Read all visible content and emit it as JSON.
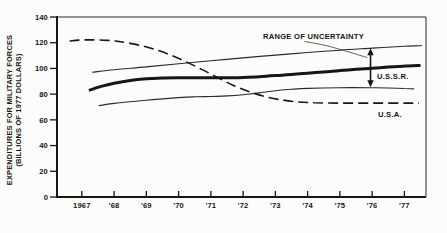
{
  "figure": {
    "background": "#fcfcfa",
    "ink": "#161616",
    "thin_line_color": "#2a2a2a",
    "pointer_line_color": "#3a3a3a"
  },
  "chart_data": {
    "type": "line",
    "title": "",
    "ylabel_line1": "EXPENDITURES FOR MILITARY FORCES",
    "ylabel_line2": "(BILLIONS OF 1977 DOLLARS)",
    "xlabel": "",
    "ylim": [
      0,
      140
    ],
    "xlim": [
      1966.23,
      1977.67
    ],
    "y_ticks": [
      0,
      20,
      40,
      60,
      80,
      100,
      120,
      140
    ],
    "x_ticks": [
      {
        "year": 1967,
        "label": "1967"
      },
      {
        "year": 1968,
        "label": "'68"
      },
      {
        "year": 1969,
        "label": "'69"
      },
      {
        "year": 1970,
        "label": "'70"
      },
      {
        "year": 1971,
        "label": "'71"
      },
      {
        "year": 1972,
        "label": "'72"
      },
      {
        "year": 1973,
        "label": "'73"
      },
      {
        "year": 1974,
        "label": "'74"
      },
      {
        "year": 1975,
        "label": "'75"
      },
      {
        "year": 1976,
        "label": "'76"
      },
      {
        "year": 1977,
        "label": "'77"
      }
    ],
    "grid": false,
    "legend_position": "inline-annotations",
    "series": [
      {
        "name": "ussr-upper-uncertainty",
        "style": "thin",
        "points": [
          [
            1967.32,
            97
          ],
          [
            1968,
            99
          ],
          [
            1969,
            101.2
          ],
          [
            1970,
            103.6
          ],
          [
            1971,
            106
          ],
          [
            1972,
            108.2
          ],
          [
            1973,
            110.4
          ],
          [
            1974,
            112.4
          ],
          [
            1975,
            114.2
          ],
          [
            1976,
            115.8
          ],
          [
            1977,
            117.2
          ],
          [
            1977.55,
            117.8
          ]
        ]
      },
      {
        "name": "ussr-estimate",
        "style": "thick",
        "points": [
          [
            1967.22,
            83
          ],
          [
            1967.6,
            86
          ],
          [
            1968,
            88.5
          ],
          [
            1968.5,
            90.7
          ],
          [
            1969,
            92
          ],
          [
            1969.5,
            92.6
          ],
          [
            1970,
            92.8
          ],
          [
            1970.5,
            92.8
          ],
          [
            1971,
            92.7
          ],
          [
            1971.5,
            92.7
          ],
          [
            1972,
            93
          ],
          [
            1972.5,
            93.6
          ],
          [
            1973,
            94.4
          ],
          [
            1973.5,
            95.3
          ],
          [
            1974,
            96.3
          ],
          [
            1974.5,
            97.3
          ],
          [
            1975,
            98.3
          ],
          [
            1975.5,
            99.3
          ],
          [
            1976,
            100.2
          ],
          [
            1976.5,
            101
          ],
          [
            1977,
            101.8
          ],
          [
            1977.5,
            102.3
          ]
        ]
      },
      {
        "name": "ussr-lower-uncertainty",
        "style": "thin",
        "points": [
          [
            1967.52,
            71
          ],
          [
            1968,
            72.8
          ],
          [
            1969,
            75.3
          ],
          [
            1970,
            77.3
          ],
          [
            1970.5,
            77.9
          ],
          [
            1971,
            78.2
          ],
          [
            1971.5,
            78.6
          ],
          [
            1972,
            79.6
          ],
          [
            1972.5,
            81
          ],
          [
            1973,
            82.7
          ],
          [
            1973.5,
            83.8
          ],
          [
            1974,
            84.5
          ],
          [
            1975,
            85
          ],
          [
            1976,
            85
          ],
          [
            1976.5,
            84.8
          ],
          [
            1977,
            84.4
          ],
          [
            1977.3,
            84.1
          ]
        ]
      },
      {
        "name": "usa",
        "style": "dashed",
        "points": [
          [
            1966.62,
            121.3
          ],
          [
            1966.9,
            122
          ],
          [
            1967.3,
            122.2
          ],
          [
            1967.8,
            121.8
          ],
          [
            1968.2,
            120.8
          ],
          [
            1968.7,
            118.5
          ],
          [
            1969.2,
            115.3
          ],
          [
            1969.7,
            111
          ],
          [
            1970.2,
            105.5
          ],
          [
            1970.7,
            99.5
          ],
          [
            1971.2,
            93
          ],
          [
            1971.7,
            86.8
          ],
          [
            1972.2,
            81.8
          ],
          [
            1972.7,
            78
          ],
          [
            1973.2,
            75.5
          ],
          [
            1973.7,
            74
          ],
          [
            1974.2,
            73.3
          ],
          [
            1975,
            73
          ],
          [
            1976,
            73
          ],
          [
            1977,
            73
          ],
          [
            1977.45,
            73
          ]
        ]
      }
    ],
    "annotations": {
      "range_label": {
        "text": "RANGE OF UNCERTAINTY"
      },
      "ussr_label": {
        "text": "U.S.S.R."
      },
      "usa_label": {
        "text": "U.S.A."
      },
      "arrow": {
        "year": 1975.95,
        "from_value": 115.6,
        "to_value": 85.4
      },
      "pointer": {
        "points": [
          [
            1973.9,
            121
          ],
          [
            1974.6,
            117.6
          ],
          [
            1975.3,
            112.6
          ],
          [
            1975.85,
            108.4
          ]
        ]
      }
    }
  }
}
